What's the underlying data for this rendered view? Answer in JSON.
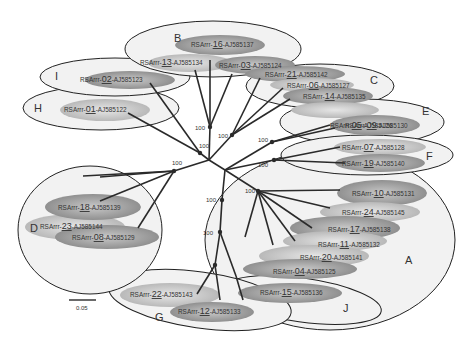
{
  "diagram": {
    "type": "unrooted phylogenetic tree",
    "scale_bar": {
      "label": "0.05"
    },
    "bootstrap_label": "100",
    "groups": [
      {
        "letter": "A",
        "leaves": [
          {
            "prefix": "RSArrr-",
            "num": "10",
            "acc": "-AJ585131"
          },
          {
            "prefix": "RSArrr-",
            "num": "24",
            "acc": "-AJ585145"
          },
          {
            "prefix": "RSArrr-",
            "num": "17",
            "acc": "-AJ585138"
          },
          {
            "prefix": "RSArrr-",
            "num": "11",
            "acc": "-AJ585132"
          },
          {
            "prefix": "RSArrr-",
            "num": "20",
            "acc": "-AJ585141"
          },
          {
            "prefix": "RSArrr-",
            "num": "04",
            "acc": "-AJ585125"
          }
        ]
      },
      {
        "letter": "B",
        "leaves": [
          {
            "prefix": "RSArrr-",
            "num": "16",
            "acc": "-AJ585137"
          },
          {
            "prefix": "RSArrr-",
            "num": "13",
            "acc": "-AJ585134"
          },
          {
            "prefix": "RSArrr-",
            "num": "03",
            "acc": "-AJ585124"
          }
        ]
      },
      {
        "letter": "C",
        "leaves": [
          {
            "prefix": "RSArrr-",
            "num": "21",
            "acc": "-AJ585142"
          },
          {
            "prefix": "RSArrr-",
            "num": "06",
            "acc": "-AJ585127"
          },
          {
            "prefix": "RSArrr-",
            "num": "14",
            "acc": "-AJ585135"
          }
        ]
      },
      {
        "letter": "D",
        "leaves": [
          {
            "prefix": "RSArrr-",
            "num": "23",
            "acc": "-AJ585144"
          },
          {
            "prefix": "RSArrr-",
            "num": "18",
            "acc": "-AJ585139"
          },
          {
            "prefix": "RSArrr-",
            "num": "08",
            "acc": "-AJ585129"
          }
        ]
      },
      {
        "letter": "E",
        "leaves": [
          {
            "prefix": "RSArrr-",
            "num": "05",
            "acc": "-AJ585126"
          },
          {
            "prefix": "RSArrr-",
            "num": "09",
            "acc": "-AJ585130"
          }
        ]
      },
      {
        "letter": "F",
        "leaves": [
          {
            "prefix": "RSArrr-",
            "num": "07",
            "acc": "-AJ585128"
          },
          {
            "prefix": "RSArrr-",
            "num": "19",
            "acc": "-AJ585140"
          }
        ]
      },
      {
        "letter": "G",
        "leaves": [
          {
            "prefix": "RSArrr-",
            "num": "22",
            "acc": "-AJ585143"
          },
          {
            "prefix": "RSArrr-",
            "num": "12",
            "acc": "-AJ585133"
          }
        ]
      },
      {
        "letter": "H",
        "leaves": [
          {
            "prefix": "RSArrr-",
            "num": "01",
            "acc": "-AJ585122"
          }
        ]
      },
      {
        "letter": "I",
        "leaves": [
          {
            "prefix": "RSArrr-",
            "num": "02",
            "acc": "-AJ585123"
          }
        ]
      },
      {
        "letter": "J",
        "leaves": [
          {
            "prefix": "RSArrr-",
            "num": "15",
            "acc": "-AJ585136"
          }
        ]
      }
    ]
  },
  "colors": {
    "group_fill": "#f2f2f2",
    "leaf_light": "#d6d6d6",
    "leaf_dark": "#8c8c8c",
    "line": "#2a2a2a"
  }
}
